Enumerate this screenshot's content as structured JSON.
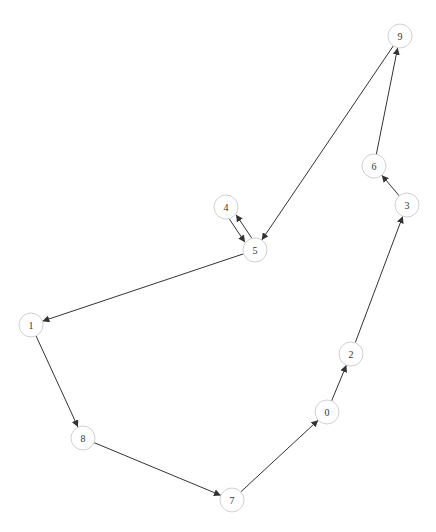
{
  "diagram": {
    "type": "directed-graph",
    "node_radius": 12,
    "colors": {
      "node_stroke": "#d0d0d0",
      "node_fill": "#ffffff",
      "edge": "#333333",
      "label": "#333333"
    },
    "nodes": [
      {
        "id": "0",
        "label": "0",
        "x": 327,
        "y": 412
      },
      {
        "id": "1",
        "label": "1",
        "x": 31,
        "y": 325
      },
      {
        "id": "2",
        "label": "2",
        "x": 351,
        "y": 354
      },
      {
        "id": "3",
        "label": "3",
        "x": 407,
        "y": 205
      },
      {
        "id": "4",
        "label": "4",
        "x": 226,
        "y": 207
      },
      {
        "id": "5",
        "label": "5",
        "x": 255,
        "y": 250
      },
      {
        "id": "6",
        "label": "6",
        "x": 374,
        "y": 166
      },
      {
        "id": "7",
        "label": "7",
        "x": 232,
        "y": 500
      },
      {
        "id": "8",
        "label": "8",
        "x": 83,
        "y": 438
      },
      {
        "id": "9",
        "label": "9",
        "x": 400,
        "y": 36
      }
    ],
    "edges": [
      {
        "from": "9",
        "to": "5"
      },
      {
        "from": "5",
        "to": "1"
      },
      {
        "from": "1",
        "to": "8"
      },
      {
        "from": "8",
        "to": "7"
      },
      {
        "from": "7",
        "to": "0"
      },
      {
        "from": "0",
        "to": "2"
      },
      {
        "from": "2",
        "to": "3"
      },
      {
        "from": "3",
        "to": "6"
      },
      {
        "from": "6",
        "to": "9"
      },
      {
        "from": "4",
        "to": "5"
      },
      {
        "from": "5",
        "to": "4"
      }
    ]
  }
}
